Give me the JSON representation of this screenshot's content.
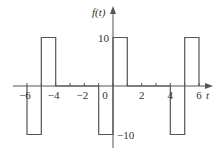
{
  "chart_data": {
    "type": "line",
    "title": "",
    "xlabel": "t",
    "ylabel": "f(t)",
    "xlim": [
      -6.5,
      7
    ],
    "ylim": [
      -12,
      15
    ],
    "grid": false,
    "legend": null,
    "x_ticks": [
      -6,
      -5,
      -4,
      -3,
      -2,
      -1,
      0,
      1,
      2,
      3,
      4,
      5,
      6
    ],
    "x_tick_labels": [
      {
        "t": -6,
        "label": "−6"
      },
      {
        "t": -4,
        "label": "−4"
      },
      {
        "t": -2,
        "label": "−2"
      },
      {
        "t": 0,
        "label": "0"
      },
      {
        "t": 2,
        "label": "2"
      },
      {
        "t": 4,
        "label": "4"
      },
      {
        "t": 6,
        "label": "6"
      }
    ],
    "y_tick_labels": [
      {
        "v": 10,
        "label": "10"
      },
      {
        "v": -10,
        "label": "−10"
      }
    ],
    "series": [
      {
        "name": "f(t)",
        "x": [
          -6,
          -6,
          -5,
          -5,
          -4,
          -4,
          -1,
          -1,
          0,
          0,
          1,
          1,
          4,
          4,
          5,
          5,
          6,
          6
        ],
        "values": [
          0,
          -10,
          -10,
          10,
          10,
          0,
          0,
          -10,
          -10,
          10,
          10,
          0,
          0,
          -10,
          -10,
          10,
          10,
          0
        ]
      }
    ],
    "period": 5
  },
  "labels": {
    "y_axis": "f(t)",
    "x_axis": "t"
  },
  "colors": {
    "line": "#555555",
    "text": "#333333"
  }
}
